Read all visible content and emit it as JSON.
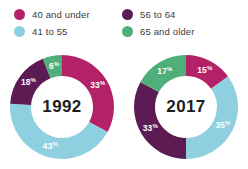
{
  "legend": {
    "columns": [
      {
        "items": [
          {
            "label": "40 and under",
            "color": "#B32166",
            "key": "40-and-under"
          },
          {
            "label": "41 to 55",
            "color": "#8ECFE0",
            "key": "41-to-55"
          }
        ]
      },
      {
        "items": [
          {
            "label": "56 to 64",
            "color": "#5C1B52",
            "key": "56-to-64"
          },
          {
            "label": "65 and older",
            "color": "#4FAF7A",
            "key": "65-and-older"
          }
        ]
      }
    ]
  },
  "chart_data": [
    {
      "type": "pie",
      "title": "1992",
      "center_label": "1992",
      "categories": [
        "40 and under",
        "41 to 55",
        "56 to 64",
        "65 and older"
      ],
      "values": [
        33,
        43,
        18,
        6
      ],
      "value_labels": [
        "33",
        "43",
        "18",
        "6"
      ],
      "value_suffix": "%",
      "colors": [
        "#B32166",
        "#8ECFE0",
        "#5C1B52",
        "#4FAF7A"
      ],
      "donut": true,
      "start_angle_deg": 0,
      "direction": "clockwise",
      "legend_position": "top",
      "xlabel": "",
      "ylabel": ""
    },
    {
      "type": "pie",
      "title": "2017",
      "center_label": "2017",
      "categories": [
        "40 and under",
        "41 to 55",
        "56 to 64",
        "65 and older"
      ],
      "values": [
        15,
        35,
        33,
        17
      ],
      "value_labels": [
        "15",
        "35",
        "33",
        "17"
      ],
      "value_suffix": "%",
      "colors": [
        "#B32166",
        "#8ECFE0",
        "#5C1B52",
        "#4FAF7A"
      ],
      "donut": true,
      "start_angle_deg": 0,
      "direction": "clockwise",
      "legend_position": "top",
      "xlabel": "",
      "ylabel": ""
    }
  ],
  "geometry": {
    "outer_radius": 52,
    "inner_radius": 31,
    "label_radius": 41.5,
    "viewbox": 112
  }
}
